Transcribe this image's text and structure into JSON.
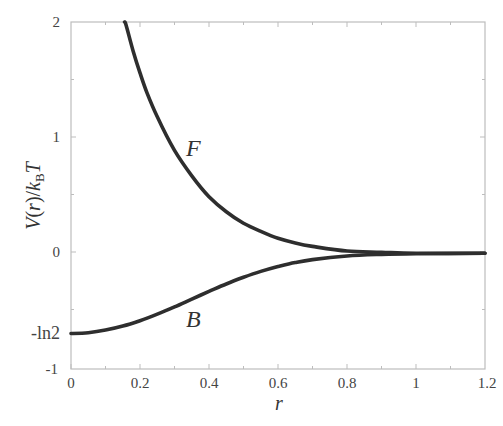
{
  "chart_data": {
    "type": "line",
    "title": "",
    "xlabel": "r",
    "ylabel": "V(r)/k_B T",
    "ylabel_parts": {
      "V": "V",
      "open": "(",
      "r": "r",
      "close": ")/",
      "k": "k",
      "sub": "B",
      "T": "T"
    },
    "xlim": [
      0,
      1.2
    ],
    "ylim": [
      -1,
      2
    ],
    "grid": false,
    "legend": "none",
    "x_ticks": [
      "0",
      "0.2",
      "0.4",
      "0.6",
      "0.8",
      "1",
      "1.2"
    ],
    "y_ticks": [
      "-1",
      "-ln2",
      "0",
      "1",
      "2"
    ],
    "annotations": [
      {
        "text": "F",
        "x": 0.37,
        "y": 0.9
      },
      {
        "text": "B",
        "x": 0.37,
        "y": -0.62
      }
    ],
    "series": [
      {
        "name": "F",
        "x": [
          0.155,
          0.16,
          0.18,
          0.2,
          0.22,
          0.25,
          0.3,
          0.35,
          0.4,
          0.45,
          0.5,
          0.55,
          0.6,
          0.65,
          0.7,
          0.8,
          0.9,
          1.0,
          1.2
        ],
        "values": [
          2.0,
          1.97,
          1.75,
          1.56,
          1.39,
          1.18,
          0.89,
          0.67,
          0.49,
          0.36,
          0.26,
          0.19,
          0.13,
          0.09,
          0.06,
          0.02,
          0.01,
          0.0,
          0.0
        ]
      },
      {
        "name": "B",
        "x": [
          0,
          0.05,
          0.1,
          0.15,
          0.2,
          0.25,
          0.3,
          0.35,
          0.4,
          0.45,
          0.5,
          0.55,
          0.6,
          0.65,
          0.7,
          0.8,
          0.9,
          1.0,
          1.2
        ],
        "values": [
          -0.693,
          -0.686,
          -0.664,
          -0.629,
          -0.582,
          -0.526,
          -0.463,
          -0.396,
          -0.329,
          -0.265,
          -0.207,
          -0.156,
          -0.114,
          -0.08,
          -0.054,
          -0.023,
          -0.009,
          -0.003,
          0.0
        ]
      }
    ]
  },
  "labels": {
    "xlabel": "r",
    "curve_F": "F",
    "curve_B": "B",
    "ylabel_V": "V",
    "ylabel_open": "(",
    "ylabel_r": "r",
    "ylabel_close": ")/",
    "ylabel_k": "k",
    "ylabel_sub": "B",
    "ylabel_T": "T",
    "xticks": [
      "0",
      "0.2",
      "0.4",
      "0.6",
      "0.8",
      "1",
      "1.2"
    ],
    "yticks": {
      "neg1": "-1",
      "negln2": "-ln2",
      "zero": "0",
      "one": "1",
      "two": "2"
    }
  }
}
